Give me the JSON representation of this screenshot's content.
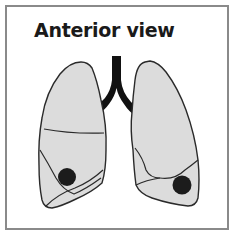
{
  "title": "Anterior view",
  "colors": {
    "frame": "#8a8a8a",
    "lung_fill": "#dcdcdc",
    "outline": "#2a2a2a",
    "trachea": "#111111",
    "nodule": "#1c1c1c"
  },
  "elements": {
    "right_lung": {
      "label": "",
      "nodule": {
        "cx": 67,
        "cy": 177,
        "r": 9
      }
    },
    "left_lung": {
      "label": "",
      "nodule": {
        "cx": 182,
        "cy": 185,
        "r": 9.5
      }
    }
  }
}
